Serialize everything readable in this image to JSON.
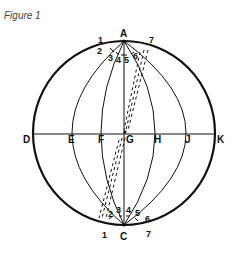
{
  "figure": {
    "title": "Figure 1"
  },
  "labels": {
    "A": "A",
    "C": "C",
    "D": "D",
    "E": "E",
    "F": "F",
    "G": "G",
    "H": "H",
    "J": "J",
    "K": "K"
  },
  "top_numbers": [
    "1",
    "2",
    "3",
    "4",
    "5",
    "6",
    "7"
  ],
  "bottom_numbers": [
    "1",
    "2",
    "3",
    "4",
    "5",
    "6",
    "7"
  ],
  "colors": {
    "stroke": "#111111",
    "title": "#444444",
    "background": "#ffffff"
  }
}
